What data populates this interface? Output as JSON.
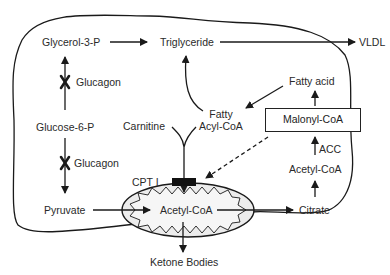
{
  "diagram": {
    "nodes": {
      "glycerol3p": "Glycerol-3-P",
      "triglyceride": "Triglyceride",
      "vldl": "VLDL",
      "glucagon_top": "Glucagon",
      "glucose6p": "Glucose-6-P",
      "carnitine": "Carnitine",
      "fatty_acyl_coa_1": "Fatty",
      "fatty_acyl_coa_2": "Acyl-CoA",
      "fatty_acid": "Fatty acid",
      "malonyl_coa": "Malonyl-CoA",
      "acc": "ACC",
      "acetyl_coa_cyto": "Acetyl-CoA",
      "glucagon_bottom": "Glucagon",
      "cpt1": "CPT I",
      "pyruvate": "Pyruvate",
      "acetyl_coa_mito": "Acetyl-CoA",
      "citrate": "Citrate",
      "ketone_bodies": "Ketone Bodies"
    },
    "edges": [
      {
        "from": "Glycerol-3-P",
        "to": "Triglyceride",
        "style": "solid"
      },
      {
        "from": "Triglyceride",
        "to": "VLDL",
        "style": "solid"
      },
      {
        "from": "Glucose-6-P",
        "to": "Glycerol-3-P",
        "style": "solid",
        "inhibited_by": "Glucagon"
      },
      {
        "from": "Glucose-6-P",
        "to": "Pyruvate",
        "style": "solid",
        "inhibited_by": "Glucagon"
      },
      {
        "from": "Fatty Acyl-CoA",
        "to": "Triglyceride",
        "style": "solid"
      },
      {
        "from": "Fatty acid",
        "to": "Fatty Acyl-CoA",
        "style": "solid"
      },
      {
        "from": "Malonyl-CoA",
        "to": "Fatty acid",
        "style": "solid"
      },
      {
        "from": "Acetyl-CoA",
        "to": "Malonyl-CoA",
        "style": "solid",
        "enzyme": "ACC"
      },
      {
        "from": "Citrate",
        "to": "Acetyl-CoA",
        "style": "solid"
      },
      {
        "from": "Malonyl-CoA",
        "to": "CPT I",
        "style": "dashed"
      },
      {
        "from": "Carnitine + Fatty Acyl-CoA",
        "to": "Acetyl-CoA (mitochondria)",
        "via": "CPT I",
        "style": "solid"
      },
      {
        "from": "Pyruvate",
        "to": "Acetyl-CoA (mitochondria)",
        "style": "solid"
      },
      {
        "from": "Acetyl-CoA (mitochondria)",
        "to": "Citrate",
        "style": "solid"
      },
      {
        "from": "Acetyl-CoA (mitochondria)",
        "to": "Ketone Bodies",
        "style": "solid"
      }
    ],
    "colors": {
      "line": "#1a1a1a",
      "mitochondrion_fill": "#ececec",
      "cpt_block": "#111111"
    }
  }
}
